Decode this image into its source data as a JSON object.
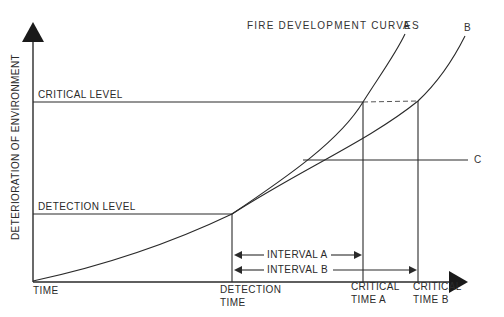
{
  "title": "FIRE DEVELOPMENT CURVES",
  "axes": {
    "y_label": "DETERIORATION OF ENVIRONMENT",
    "x_label": "TIME"
  },
  "levels": {
    "critical": "CRITICAL LEVEL",
    "detection": "DETECTION LEVEL"
  },
  "curves": {
    "a": "A",
    "b": "B",
    "c": "C"
  },
  "intervals": {
    "a": "INTERVAL A",
    "b": "INTERVAL B"
  },
  "time_marks": {
    "detection_line1": "DETECTION",
    "detection_line2": "TIME",
    "critical_a_line1": "CRITICAL",
    "critical_a_line2": "TIME A",
    "critical_b_line1": "CRITICAL",
    "critical_b_line2": "TIME B"
  },
  "colors": {
    "stroke": "#2a2a2a",
    "background": "#ffffff"
  }
}
